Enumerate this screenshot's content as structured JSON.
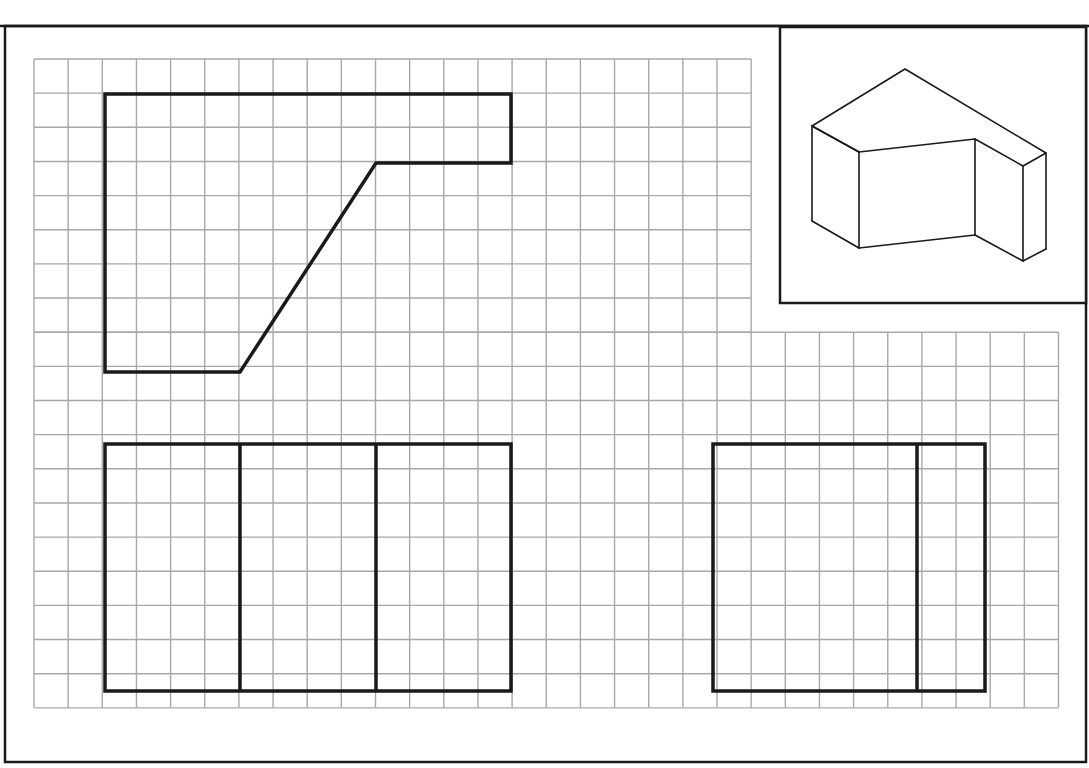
{
  "sheet": {
    "title": "Orthographic projection exercise",
    "frame": {
      "x": 5,
      "y": 26,
      "w": 1081,
      "h": 736
    },
    "top_border_y": 26
  },
  "grid": {
    "origin_x": 34,
    "origin_y": 59,
    "pitch": 34.15,
    "upper_region": {
      "cols": 21,
      "rows": 8
    },
    "lower_region": {
      "cols": 30,
      "rows": 11,
      "start_row": 8
    },
    "line_color": "#a8a8a8"
  },
  "views": {
    "top_view": {
      "points": "105,94 511,94 511,163 376,163 240,372 105,372"
    },
    "front_view": {
      "x": 105,
      "y": 444,
      "w": 406,
      "h": 247,
      "dividers_x": [
        240,
        376
      ]
    },
    "side_view": {
      "x": 713,
      "y": 444,
      "w": 272,
      "h": 247,
      "dividers_x": [
        917
      ]
    }
  },
  "isometric_inset": {
    "box": {
      "x": 780,
      "y": 27,
      "w": 306,
      "h": 276
    },
    "top_face": "812,126 905,69 1046,153 1023,166 975,139 859,152",
    "edges": [
      [
        812,
        126,
        859,
        152
      ],
      [
        859,
        152,
        859,
        248
      ],
      [
        812,
        126,
        812,
        221
      ],
      [
        812,
        221,
        859,
        248
      ],
      [
        859,
        248,
        975,
        235
      ],
      [
        975,
        139,
        975,
        235
      ],
      [
        975,
        235,
        1023,
        261
      ],
      [
        1023,
        166,
        1023,
        261
      ],
      [
        1046,
        153,
        1046,
        249
      ],
      [
        1023,
        261,
        1046,
        249
      ]
    ]
  },
  "colors": {
    "ink": "#1a1a1a",
    "grid": "#a8a8a8",
    "paper": "#ffffff"
  }
}
